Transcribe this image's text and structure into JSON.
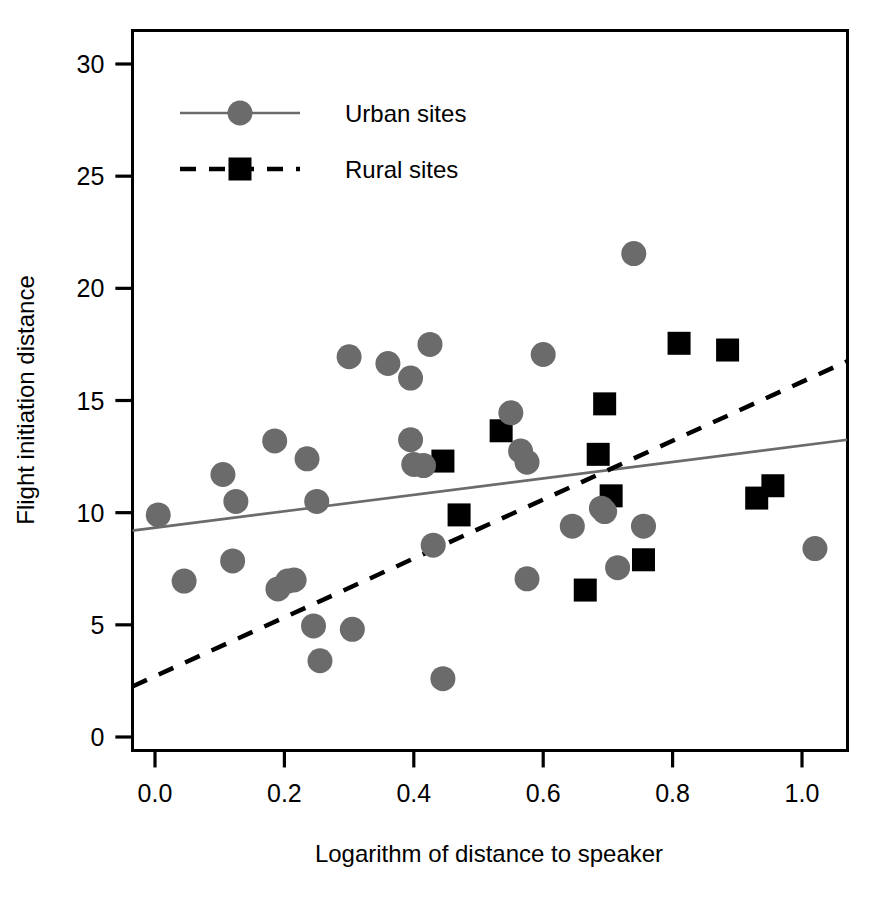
{
  "chart_data": {
    "type": "scatter",
    "title": "",
    "xlabel": "Logarithm of distance to speaker",
    "ylabel": "Flight initiation distance",
    "xlim": [
      -0.035,
      1.07
    ],
    "ylim": [
      -0.6,
      31.5
    ],
    "xticks": [
      0.0,
      0.2,
      0.4,
      0.6,
      0.8,
      1.0
    ],
    "xtick_labels": [
      "0.0",
      "0.2",
      "0.4",
      "0.6",
      "0.8",
      "1.0"
    ],
    "yticks": [
      0,
      5,
      10,
      15,
      20,
      25,
      30
    ],
    "ytick_labels": [
      "0",
      "5",
      "10",
      "15",
      "20",
      "25",
      "30"
    ],
    "grid": false,
    "legend_position": "top-left",
    "colors": {
      "urban": "#6b6b6b",
      "rural": "#000000",
      "axis": "#000000",
      "background": "#ffffff"
    },
    "series": [
      {
        "name": "Urban sites",
        "marker": "circle",
        "color": "#6b6b6b",
        "line_style": "solid",
        "points": [
          {
            "x": 0.005,
            "y": 9.9
          },
          {
            "x": 0.045,
            "y": 6.95
          },
          {
            "x": 0.105,
            "y": 11.7
          },
          {
            "x": 0.12,
            "y": 7.85
          },
          {
            "x": 0.125,
            "y": 10.5
          },
          {
            "x": 0.185,
            "y": 13.2
          },
          {
            "x": 0.19,
            "y": 6.6
          },
          {
            "x": 0.205,
            "y": 6.95
          },
          {
            "x": 0.215,
            "y": 7.0
          },
          {
            "x": 0.235,
            "y": 12.4
          },
          {
            "x": 0.245,
            "y": 4.95
          },
          {
            "x": 0.25,
            "y": 10.5
          },
          {
            "x": 0.255,
            "y": 3.4
          },
          {
            "x": 0.3,
            "y": 16.95
          },
          {
            "x": 0.305,
            "y": 4.8
          },
          {
            "x": 0.36,
            "y": 16.65
          },
          {
            "x": 0.395,
            "y": 16.0
          },
          {
            "x": 0.395,
            "y": 13.25
          },
          {
            "x": 0.4,
            "y": 12.15
          },
          {
            "x": 0.415,
            "y": 12.1
          },
          {
            "x": 0.425,
            "y": 17.5
          },
          {
            "x": 0.43,
            "y": 8.55
          },
          {
            "x": 0.445,
            "y": 2.6
          },
          {
            "x": 0.55,
            "y": 14.45
          },
          {
            "x": 0.565,
            "y": 12.75
          },
          {
            "x": 0.575,
            "y": 12.25
          },
          {
            "x": 0.575,
            "y": 7.05
          },
          {
            "x": 0.6,
            "y": 17.05
          },
          {
            "x": 0.645,
            "y": 9.4
          },
          {
            "x": 0.69,
            "y": 10.2
          },
          {
            "x": 0.695,
            "y": 10.05
          },
          {
            "x": 0.715,
            "y": 7.55
          },
          {
            "x": 0.74,
            "y": 21.55
          },
          {
            "x": 0.755,
            "y": 9.4
          },
          {
            "x": 1.02,
            "y": 8.4
          }
        ]
      },
      {
        "name": "Rural sites",
        "marker": "square",
        "color": "#000000",
        "line_style": "dashed",
        "points": [
          {
            "x": 0.445,
            "y": 12.3
          },
          {
            "x": 0.47,
            "y": 9.9
          },
          {
            "x": 0.535,
            "y": 13.65
          },
          {
            "x": 0.665,
            "y": 6.55
          },
          {
            "x": 0.685,
            "y": 12.6
          },
          {
            "x": 0.695,
            "y": 14.85
          },
          {
            "x": 0.705,
            "y": 10.75
          },
          {
            "x": 0.755,
            "y": 7.9
          },
          {
            "x": 0.81,
            "y": 17.55
          },
          {
            "x": 0.885,
            "y": 17.25
          },
          {
            "x": 0.93,
            "y": 10.65
          },
          {
            "x": 0.955,
            "y": 11.2
          }
        ]
      }
    ],
    "fit_lines": [
      {
        "name": "Urban sites fit",
        "style": "solid",
        "color": "#6b6b6b",
        "x0": -0.035,
        "y0": 9.2,
        "x1": 1.07,
        "y1": 13.25
      },
      {
        "name": "Rural sites fit",
        "style": "dashed",
        "color": "#000000",
        "x0": -0.035,
        "y0": 2.25,
        "x1": 1.07,
        "y1": 16.75
      }
    ],
    "legend": [
      {
        "label": "Urban sites",
        "marker": "circle",
        "line_style": "solid",
        "color": "#6b6b6b"
      },
      {
        "label": "Rural sites",
        "marker": "square",
        "line_style": "dashed",
        "color": "#000000"
      }
    ]
  }
}
